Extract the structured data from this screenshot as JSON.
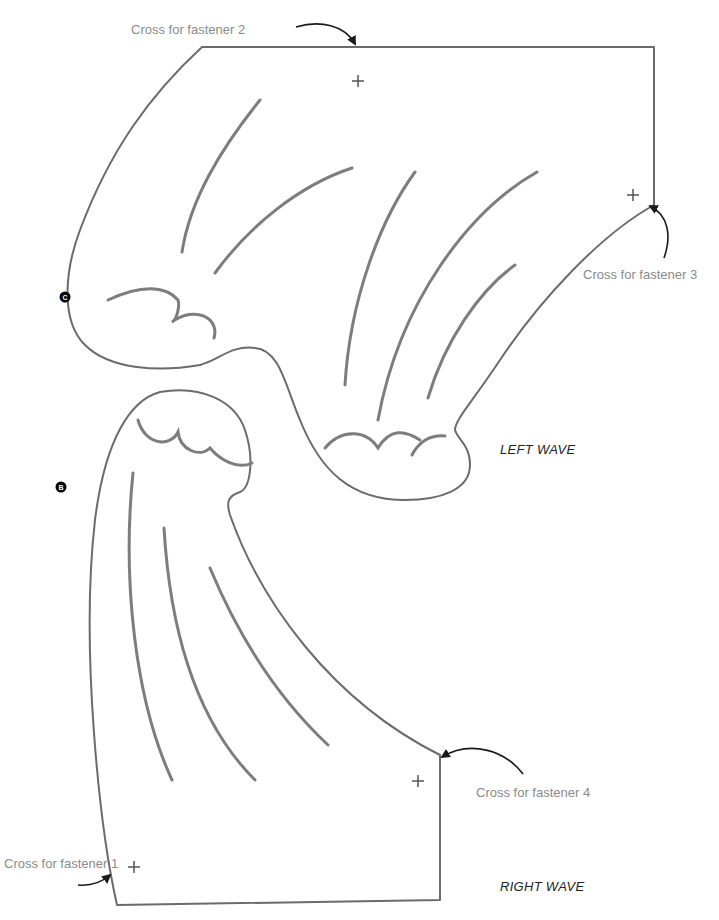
{
  "labels": {
    "fastener1": "Cross for fastener 1",
    "fastener2": "Cross for fastener 2",
    "fastener3": "Cross for fastener 3",
    "fastener4": "Cross for fastener 4",
    "left_wave": "LEFT WAVE",
    "right_wave": "RIGHT WAVE",
    "marker_c": "C",
    "marker_b": "B"
  },
  "colors": {
    "outline": "#6b6b6b",
    "texture": "#7d7d7d",
    "label_text": "#8a8a8a",
    "title_text": "#222222",
    "arrow": "#1a1a1a"
  },
  "icons": {
    "cross": "plus-cross-mark",
    "arrow": "curved-arrow",
    "marker": "black-circle-letter"
  }
}
